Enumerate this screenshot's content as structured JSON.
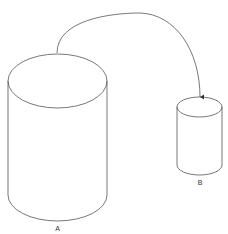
{
  "diagram": {
    "type": "cylinder-flow",
    "nodes": [
      {
        "id": "A",
        "label": "A",
        "shape": "cylinder",
        "size": "large"
      },
      {
        "id": "B",
        "label": "B",
        "shape": "cylinder",
        "size": "small"
      }
    ],
    "edges": [
      {
        "from": "A",
        "to": "B",
        "style": "curved-arrow"
      }
    ],
    "colors": {
      "stroke": "#555555",
      "background": "#ffffff",
      "label": "#333333"
    }
  }
}
